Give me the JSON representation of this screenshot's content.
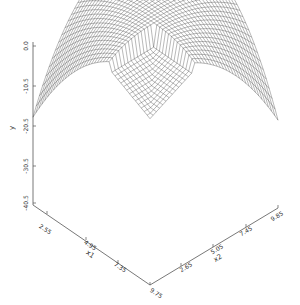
{
  "chart_data": {
    "type": "surface3d-wireframe",
    "title": "",
    "axes": {
      "x1": {
        "label": "x1",
        "ticks": [
          "2.55",
          "4.95",
          "7.35",
          "9.75"
        ],
        "range": [
          0.15,
          9.75
        ]
      },
      "x2": {
        "label": "x2",
        "ticks": [
          "2.65",
          "5.05",
          "7.45",
          "9.85"
        ],
        "range": [
          0.25,
          9.85
        ]
      },
      "z": {
        "label": "y",
        "ticks": [
          "0.0",
          "-10.5",
          "-20.5",
          "-30.5",
          "-40.5"
        ],
        "range": [
          -40.5,
          0.0
        ]
      }
    },
    "grid": false,
    "legend": null,
    "colors": {
      "mesh": "#333333",
      "axes": "#555555",
      "background": "#ffffff"
    }
  }
}
